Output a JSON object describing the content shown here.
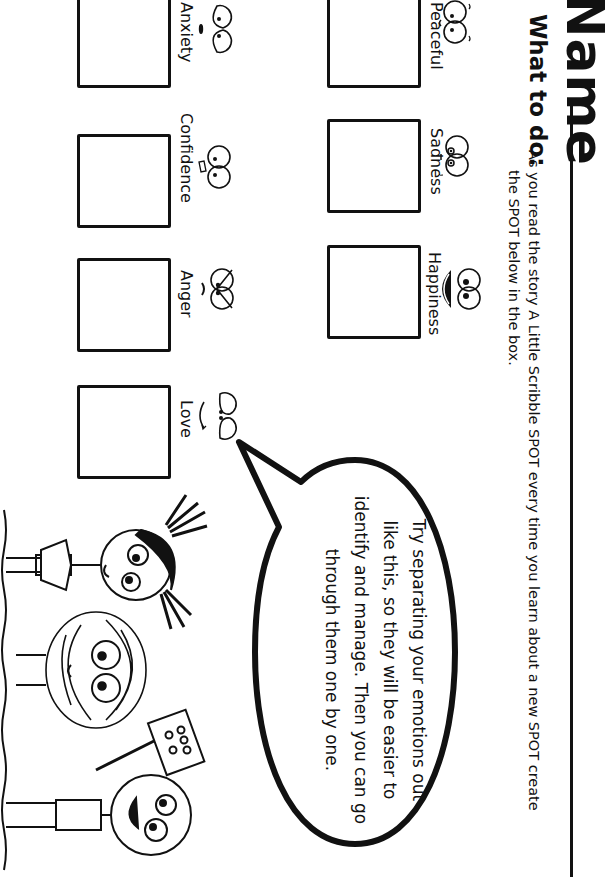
{
  "header": {
    "title": "Name",
    "what_to_do_label": "What to do:",
    "instructions_line1": "As you read the story A Little Scribble SPOT every time you learn about a new SPOT create",
    "instructions_line2": "the SPOT below in the box."
  },
  "emotions": [
    {
      "label": "Peaceful",
      "face": "peaceful-face-icon"
    },
    {
      "label": "Sadness",
      "face": "sad-face-icon"
    },
    {
      "label": "Happiness",
      "face": "happy-face-icon"
    },
    {
      "label": "Anxiety",
      "face": "anxious-face-icon"
    },
    {
      "label": "Confidence",
      "face": "confident-face-icon"
    },
    {
      "label": "Anger",
      "face": "angry-face-icon"
    },
    {
      "label": "Love",
      "face": "love-face-icon"
    }
  ],
  "speech_bubble": {
    "line1": "Try separating your emotions out",
    "line2": "like this, so they will be easier to",
    "line3": "identify and manage. Then you can go",
    "line4": "through them one by one."
  },
  "colors": {
    "ink": "#111111",
    "paper": "#ffffff"
  }
}
